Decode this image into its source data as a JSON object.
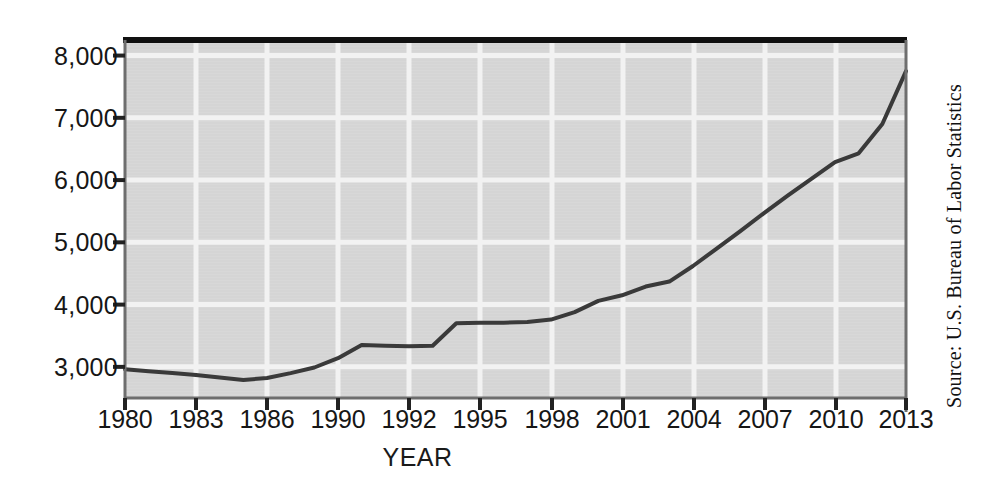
{
  "figure": {
    "axis_title_x": "YEAR",
    "source_note": "Source: U.S. Bureau of Labor Statistics",
    "colors": {
      "plot_background": "#d8d8d8",
      "gridline": "#f2f2f2",
      "series_line": "#3a3a3a",
      "axis_line": "#6e6e6e",
      "top_border": "#111111",
      "text": "#161616"
    }
  },
  "chart_data": {
    "type": "line",
    "title": "",
    "subtitle": "",
    "xlabel": "YEAR",
    "ylabel": "",
    "grid": true,
    "legend": "none",
    "xlim": [
      1980,
      2013
    ],
    "ylim": [
      2500,
      8250
    ],
    "xtick_labels": [
      "1980",
      "1983",
      "1986",
      "1990",
      "1992",
      "1995",
      "1998",
      "2001",
      "2004",
      "2007",
      "2010",
      "2013"
    ],
    "ytick_labels": [
      "3,000",
      "4,000",
      "5,000",
      "6,000",
      "7,000",
      "8,000"
    ],
    "ytick_values": [
      3000,
      4000,
      5000,
      6000,
      7000,
      8000
    ],
    "series": [
      {
        "name": "value",
        "x": [
          1980,
          1981,
          1982,
          1983,
          1984,
          1985,
          1986,
          1987,
          1988,
          1989,
          1990,
          1991,
          1992,
          1993,
          1994,
          1995,
          1996,
          1997,
          1998,
          1999,
          2000,
          2001,
          2002,
          2003,
          2004,
          2005,
          2006,
          2007,
          2008,
          2009,
          2010,
          2011,
          2012,
          2013
        ],
        "values": [
          2960,
          2930,
          2900,
          2870,
          2830,
          2790,
          2820,
          2900,
          2990,
          3140,
          3350,
          3340,
          3330,
          3340,
          3700,
          3710,
          3710,
          3720,
          3760,
          3880,
          4060,
          4150,
          4290,
          4370,
          4620,
          4900,
          5180,
          5470,
          5750,
          6020,
          6290,
          6430,
          6900,
          7750
        ]
      }
    ]
  },
  "geometry": {
    "plot_left": 125,
    "plot_right": 906,
    "plot_top": 40,
    "plot_bottom": 398,
    "y_value_at_plot_top": 8250,
    "y_value_at_plot_bottom": 2500,
    "xtick_pixel_positions": [
      125,
      196,
      267,
      338,
      409,
      480,
      552,
      623,
      694,
      765,
      836,
      906
    ]
  }
}
